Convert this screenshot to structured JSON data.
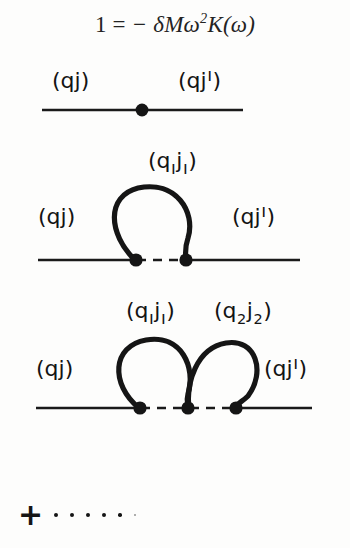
{
  "equation": {
    "lhs": "1",
    "relation": "=",
    "rhs": "− δMω",
    "exponent": "2",
    "rhs_tail": "K(ω)",
    "full": "1 = −δMω²K(ω)"
  },
  "colors": {
    "ink": "#141414",
    "background": "#fdfdfc",
    "line": "#1a1a1a"
  },
  "labels": {
    "qj": "(qj",
    "qj_close": ")",
    "qj_prime_open": "(qj",
    "qj_prime_mark": "ı",
    "qj_prime_close": ")",
    "q1j1_open": "(q",
    "q1_sub": "ı",
    "q1j1_mid": "j",
    "j1_sub": "ı",
    "q1j1_close": ")",
    "q2j2_open": "(q",
    "q2_sub": "2",
    "q2j2_mid": "j",
    "j2_sub": "2",
    "q2j2_close": ")"
  },
  "diagrams": [
    {
      "id": "one-vertex",
      "order": 1,
      "vertex_count": 1,
      "loop_count": 0,
      "dashed_links": 0,
      "left_label": "(qj)",
      "right_label": "(qjı)",
      "loop_labels": []
    },
    {
      "id": "single-loop",
      "order": 2,
      "vertex_count": 2,
      "loop_count": 1,
      "dashed_links": 1,
      "left_label": "(qj)",
      "right_label": "(qjı)",
      "loop_labels": [
        "(qıjı)"
      ]
    },
    {
      "id": "double-loop",
      "order": 3,
      "vertex_count": 3,
      "loop_count": 2,
      "dashed_links": 2,
      "left_label": "(qj)",
      "right_label": "(qjı)",
      "loop_labels": [
        "(qıjı)",
        "(q2j2)"
      ]
    }
  ],
  "tail": {
    "plus": "+",
    "ellipsis_dot_count": 6
  }
}
